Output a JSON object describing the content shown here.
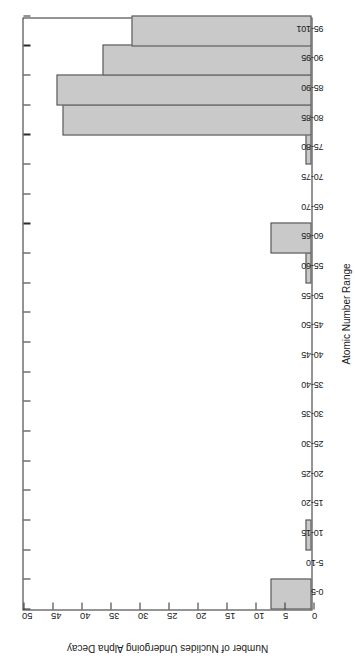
{
  "chart_data": {
    "type": "bar",
    "title": "",
    "xlabel": "Atomic Number Range",
    "ylabel": "Number of Nuclides Undergoing Alpha Decay",
    "categories": [
      "0-5",
      "5-10",
      "10-15",
      "15-20",
      "20-25",
      "25-30",
      "30-35",
      "35-40",
      "40-45",
      "45-50",
      "50-55",
      "55-60",
      "60-65",
      "65-70",
      "70-75",
      "75-80",
      "80-85",
      "85-90",
      "90-95",
      "95-101"
    ],
    "values": [
      7,
      0,
      1,
      0,
      0,
      0,
      0,
      0,
      0,
      0,
      0,
      1,
      7,
      0,
      0,
      1,
      43,
      44,
      36,
      31
    ],
    "ylim": [
      0,
      50
    ],
    "yticks": [
      0,
      5,
      10,
      15,
      20,
      25,
      30,
      35,
      40,
      45,
      50
    ],
    "ytick_labels": [
      "0",
      "5",
      "10",
      "15",
      "20",
      "25",
      "30",
      "35",
      "40",
      "45",
      "50"
    ],
    "grid": false,
    "legend": false,
    "orientation": "rotated-90-ccw",
    "bar_fill_color": "#c9c9c9",
    "bar_edge_color": "#4a4a4a",
    "axis_color": "#2b2b2b",
    "background_color": "#ffffff"
  }
}
